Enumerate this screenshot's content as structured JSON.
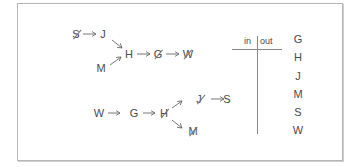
{
  "diagram": {
    "graph1": {
      "nodes": [
        {
          "id": "S",
          "label": "S",
          "crossed": true
        },
        {
          "id": "J",
          "label": "J",
          "crossed": false
        },
        {
          "id": "M",
          "label": "M",
          "crossed": false
        },
        {
          "id": "H",
          "label": "H",
          "crossed": false
        },
        {
          "id": "G",
          "label": "G",
          "crossed": true
        },
        {
          "id": "W",
          "label": "W",
          "crossed": true
        }
      ],
      "edges": [
        [
          "S",
          "J"
        ],
        [
          "J",
          "H"
        ],
        [
          "M",
          "H"
        ],
        [
          "H",
          "G"
        ],
        [
          "G",
          "W"
        ]
      ]
    },
    "graph2": {
      "nodes": [
        {
          "id": "W",
          "label": "W",
          "crossed": false
        },
        {
          "id": "G",
          "label": "G",
          "crossed": false
        },
        {
          "id": "H",
          "label": "H",
          "crossed": true
        },
        {
          "id": "J",
          "label": "J",
          "crossed": true
        },
        {
          "id": "S",
          "label": "S",
          "crossed": false
        },
        {
          "id": "M",
          "label": "M",
          "crossed": true
        }
      ],
      "edges": [
        [
          "W",
          "G"
        ],
        [
          "G",
          "H"
        ],
        [
          "H",
          "J"
        ],
        [
          "J",
          "S"
        ],
        [
          "H",
          "M"
        ]
      ]
    },
    "table": {
      "headers": [
        "in",
        "out"
      ],
      "letters": [
        "G",
        "H",
        "J",
        "M",
        "S",
        "W"
      ]
    }
  }
}
